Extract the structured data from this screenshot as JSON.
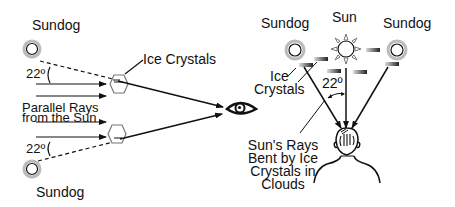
{
  "left_panel": {
    "sundog_top_label": "Sundog",
    "sundog_bottom_label": "Sundog",
    "ice_crystals_label": "Ice Crystals",
    "angle_top": "22º",
    "angle_bottom": "22º",
    "parallel_rays_line1": "Parallel Rays",
    "parallel_rays_line2": "from the Sun"
  },
  "right_panel": {
    "sundog_left_label": "Sundog",
    "sun_label": "Sun",
    "sundog_right_label": "Sundog",
    "ice_crystals_line1": "Ice",
    "ice_crystals_line2": "Crystals",
    "angle": "22º",
    "caption_line1": "Sun's Rays",
    "caption_line2": "Bent by Ice",
    "caption_line3": "Crystals in",
    "caption_line4": "Clouds"
  },
  "icons": [
    "sundog-icon",
    "sun-icon",
    "ice-crystal-hexagon-icon",
    "ice-crystal-plate-icon",
    "eye-icon",
    "observer-head-icon"
  ]
}
